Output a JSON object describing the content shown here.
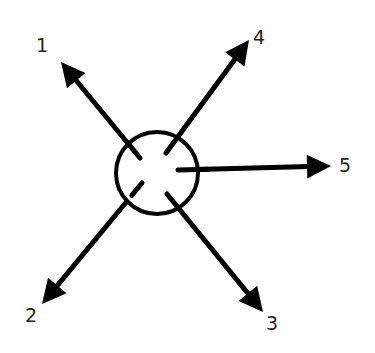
{
  "diagram": {
    "colors": {
      "stroke": "#000000",
      "label": "#222222",
      "background": "#ffffff"
    },
    "hub": {
      "shape": "circle"
    },
    "arrows": [
      {
        "id": "1",
        "label": "1",
        "direction": "up-left"
      },
      {
        "id": "2",
        "label": "2",
        "direction": "down-left"
      },
      {
        "id": "3",
        "label": "3",
        "direction": "down-right"
      },
      {
        "id": "4",
        "label": "4",
        "direction": "up-right"
      },
      {
        "id": "5",
        "label": "5",
        "direction": "right"
      }
    ]
  }
}
